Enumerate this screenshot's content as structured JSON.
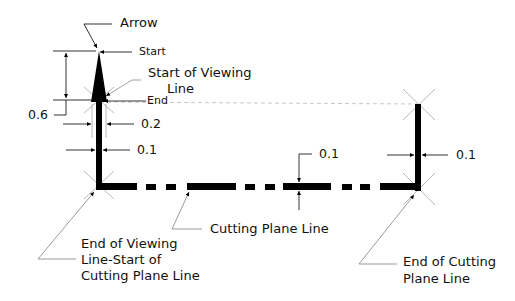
{
  "diagram": {
    "title": "",
    "labels": {
      "arrow": "Arrow",
      "start": "Start",
      "start_of_viewing_line_1": "Start of Viewing",
      "start_of_viewing_line_2": "Line",
      "end": "End",
      "dim_0_6": "0.6",
      "dim_0_2": "0.2",
      "dim_0_1_left": "0.1",
      "dim_0_1_middle": "0.1",
      "dim_0_1_right": "0.1",
      "cutting_plane_line": "Cutting Plane Line",
      "end_of_viewing_1": "End of Viewing",
      "end_of_viewing_2": "Line-Start of",
      "end_of_viewing_3": "Cutting Plane Line",
      "end_of_cutting_1": "End of Cutting",
      "end_of_cutting_2": "Plane Line"
    },
    "colors": {
      "line": "#000000",
      "construction": "#a0a0a0",
      "text": "#111111"
    }
  }
}
